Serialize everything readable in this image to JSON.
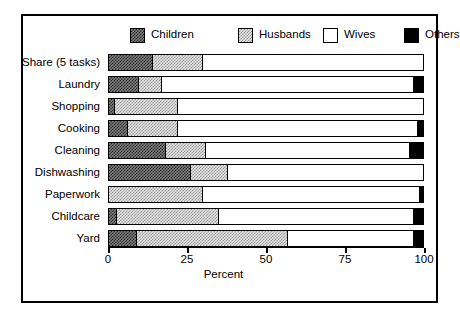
{
  "chart_data": {
    "type": "bar",
    "orientation": "horizontal",
    "stacked": true,
    "title": "",
    "xlabel": "Percent",
    "ylabel": "",
    "xlim": [
      0,
      100
    ],
    "xticks": [
      0,
      25,
      50,
      75,
      100
    ],
    "xticklabels": [
      "0",
      "25",
      "50",
      "75",
      "100"
    ],
    "grid": false,
    "legend_position": "top",
    "categories": [
      "Share (5 tasks)",
      "Laundry",
      "Shopping",
      "Cooking",
      "Cleaning",
      "Dishwashing",
      "Paperwork",
      "Childcare",
      "Yard"
    ],
    "series": [
      {
        "name": "Children",
        "pattern": "dark-checkered",
        "color": "#7d7d7d",
        "values": [
          14,
          9.5,
          2,
          6,
          18,
          26,
          0,
          2.5,
          9
        ]
      },
      {
        "name": "Husbands",
        "pattern": "light-dotted",
        "color": "#e3e3e3",
        "values": [
          16,
          7.5,
          20,
          16,
          13,
          12,
          30,
          32.5,
          48
        ]
      },
      {
        "name": "Wives",
        "pattern": "solid-white",
        "color": "#ffffff",
        "values": [
          70,
          80,
          78,
          76.5,
          65,
          62,
          69,
          62,
          40
        ]
      },
      {
        "name": "Others",
        "pattern": "solid-black",
        "color": "#000000",
        "values": [
          0,
          3,
          0,
          1.5,
          4,
          0,
          1,
          3,
          3
        ]
      }
    ]
  },
  "legend": {
    "items": [
      {
        "label": "Children",
        "swatch": "pat-children"
      },
      {
        "label": "Husbands",
        "swatch": "pat-husbands"
      },
      {
        "label": "Wives",
        "swatch": "pat-wives"
      },
      {
        "label": "Others",
        "swatch": "pat-others"
      }
    ]
  },
  "axis": {
    "x_title": "Percent"
  }
}
